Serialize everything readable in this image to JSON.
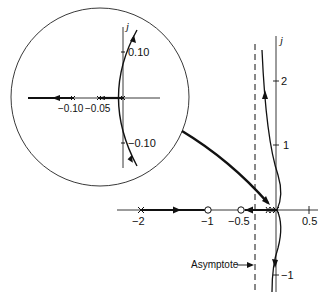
{
  "figure": {
    "type": "root-locus",
    "main_plot": {
      "imag_axis_label": "j",
      "real_ticks": [
        {
          "value": -2,
          "label": "−2"
        },
        {
          "value": -1,
          "label": "−1"
        },
        {
          "value": -0.5,
          "label": "−0.5"
        },
        {
          "value": 0.5,
          "label": "0.5"
        }
      ],
      "imag_ticks": [
        {
          "value": 2,
          "label": "2"
        },
        {
          "value": 1,
          "label": "1"
        },
        {
          "value": -1,
          "label": "−1"
        }
      ],
      "poles": [
        -2,
        0,
        -0.05,
        -0.1
      ],
      "zeros": [
        -1,
        -0.5
      ],
      "asymptote_label": "Asymptote",
      "asymptote_real": -0.33
    },
    "inset": {
      "imag_axis_label": "j",
      "real_ticks": [
        {
          "value": -0.1,
          "label": "−0.10"
        },
        {
          "value": -0.05,
          "label": "−0.05"
        }
      ],
      "imag_ticks": [
        {
          "value": 0.1,
          "label": "0.10"
        },
        {
          "value": -0.1,
          "label": "−0.10"
        }
      ],
      "poles": [
        0,
        -0.05,
        -0.1
      ]
    }
  }
}
